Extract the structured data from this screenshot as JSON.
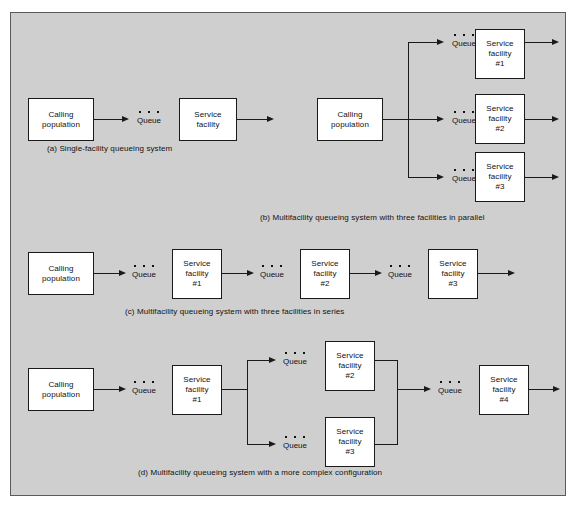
{
  "figure": {
    "background_color": "#cfcfcf",
    "border_color": "#5a5a5a",
    "node_fill": "#ffffff",
    "line_color": "#1a1a1a",
    "queue_label": "Queue",
    "calling_population_line1": "Calling",
    "calling_population_line2": "population",
    "service_line1": "Service",
    "service_line2": "facility"
  },
  "panels": {
    "a": {
      "caption": "(a)  Single-facility queueing system",
      "nodes": {
        "source": {
          "line1": "Calling",
          "line2": "population"
        },
        "facility": {
          "line1": "Service",
          "line2": "facility"
        }
      },
      "queues": {
        "q1": "Queue"
      }
    },
    "b": {
      "caption": "(b)  Multifacility queueing system with three facilities in parallel",
      "nodes": {
        "source": {
          "line1": "Calling",
          "line2": "population"
        },
        "facility1": {
          "line1": "Service",
          "line2": "facility",
          "line3": "#1"
        },
        "facility2": {
          "line1": "Service",
          "line2": "facility",
          "line3": "#2"
        },
        "facility3": {
          "line1": "Service",
          "line2": "facility",
          "line3": "#3"
        }
      },
      "queues": {
        "q1": "Queue",
        "q2": "Queue",
        "q3": "Queue"
      }
    },
    "c": {
      "caption": "(c)  Multifacility queueing system with three facilities in series",
      "nodes": {
        "source": {
          "line1": "Calling",
          "line2": "population"
        },
        "facility1": {
          "line1": "Service",
          "line2": "facility",
          "line3": "#1"
        },
        "facility2": {
          "line1": "Service",
          "line2": "facility",
          "line3": "#2"
        },
        "facility3": {
          "line1": "Service",
          "line2": "facility",
          "line3": "#3"
        }
      },
      "queues": {
        "q1": "Queue",
        "q2": "Queue",
        "q3": "Queue"
      }
    },
    "d": {
      "caption": "(d)  Multifacility queueing system with a more complex configuration",
      "nodes": {
        "source": {
          "line1": "Calling",
          "line2": "population"
        },
        "facility1": {
          "line1": "Service",
          "line2": "facility",
          "line3": "#1"
        },
        "facility2": {
          "line1": "Service",
          "line2": "facility",
          "line3": "#2"
        },
        "facility3": {
          "line1": "Service",
          "line2": "facility",
          "line3": "#3"
        },
        "facility4": {
          "line1": "Service",
          "line2": "facility",
          "line3": "#4"
        }
      },
      "queues": {
        "q1": "Queue",
        "q2": "Queue",
        "q3": "Queue",
        "q4": "Queue"
      }
    }
  }
}
